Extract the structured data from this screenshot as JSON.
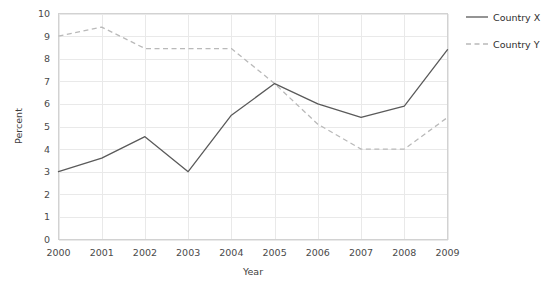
{
  "chart_data": {
    "type": "line",
    "title": "",
    "xlabel": "Year",
    "ylabel": "Percent",
    "categories": [
      "2000",
      "2001",
      "2002",
      "2003",
      "2004",
      "2005",
      "2006",
      "2007",
      "2008",
      "2009"
    ],
    "x": [
      2000,
      2001,
      2002,
      2003,
      2004,
      2005,
      2006,
      2007,
      2008,
      2009
    ],
    "series": [
      {
        "name": "Country X",
        "style": "solid",
        "color": "#5a5a5a",
        "values": [
          3.0,
          3.6,
          4.55,
          3.0,
          5.5,
          6.9,
          6.0,
          5.4,
          5.9,
          8.4
        ]
      },
      {
        "name": "Country Y",
        "style": "dashed",
        "color": "#b9b9b9",
        "values": [
          9.0,
          9.4,
          8.45,
          8.45,
          8.45,
          6.9,
          5.1,
          4.0,
          4.0,
          5.4
        ]
      }
    ],
    "ylim": [
      0,
      10
    ],
    "yticks": [
      0,
      1,
      2,
      3,
      4,
      5,
      6,
      7,
      8,
      9,
      10
    ],
    "ytick_labels": [
      "0",
      "1",
      "2",
      "3",
      "4",
      "5",
      "6",
      "7",
      "8",
      "9",
      "10"
    ],
    "xlim": [
      2000,
      2009
    ],
    "grid": true,
    "grid_axis": "both",
    "legend_position": "right",
    "legend_entries": [
      "Country X",
      "Country Y"
    ],
    "background_color": "#ffffff",
    "grid_color": "#e9e9e9"
  }
}
